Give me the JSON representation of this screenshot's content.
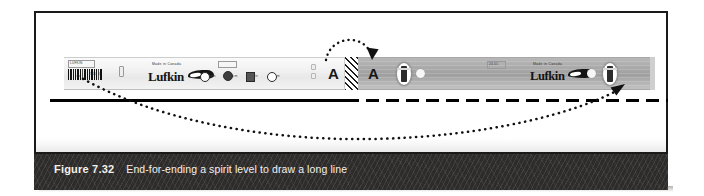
{
  "figure": {
    "caption_label": "Figure 7.32",
    "caption_body": "End-for-ending a spirit level to draw a long line",
    "panel_background": "#ffffff",
    "caption_bar_color": "#2e2c2b",
    "caption_text_color": "#f2f1ef"
  },
  "diagram": {
    "type": "technical-illustration",
    "tool": {
      "brand": "Lufkin",
      "origin_text": "Made in Canada",
      "body_color_first_position": "#f2f2f2",
      "body_color_second_position": "#a8a8a8"
    },
    "markers": [
      {
        "id": "marker-a-left",
        "label": "A",
        "meaning": "level end A before flip"
      },
      {
        "id": "marker-a-right",
        "label": "A",
        "meaning": "level end A after flip"
      }
    ],
    "pivot": {
      "name": "flip-pivot-hatch",
      "pattern": "diagonal-hatch",
      "description": "hatched block marking the pivot point where the level is end-for-ended"
    },
    "lines": [
      {
        "id": "line-drawn-solid",
        "style": "solid",
        "meaning": "line already drawn"
      },
      {
        "id": "line-extension-dashed",
        "style": "dashed",
        "meaning": "line extended after flipping the level"
      }
    ],
    "arrows": [
      {
        "id": "flip-arc-arrow",
        "style": "dotted-arc",
        "meaning": "rotate level end-for-end about the pivot"
      },
      {
        "id": "sweep-curve-arrow",
        "style": "dotted-curve",
        "meaning": "level travels from the left start point to the right end point"
      }
    ],
    "vials": [
      {
        "id": "vial-center",
        "type": "bubble-vial"
      },
      {
        "id": "vial-right",
        "type": "bubble-vial"
      }
    ]
  }
}
